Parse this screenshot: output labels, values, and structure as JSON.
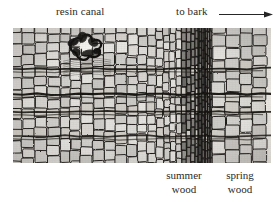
{
  "figure": {
    "type": "light-micrograph",
    "background_color": "#ffffff",
    "image_tone_color": "#e8e6e1",
    "cell_wall_color": "#1c1a18"
  },
  "annotations": {
    "resin_canal": {
      "label": "resin canal",
      "position": "top-left"
    },
    "to_bark": {
      "label": "to bark",
      "position": "top-right",
      "arrow": "arrow-right",
      "arrow_direction": "right"
    },
    "summer_wood": {
      "line1": "summer",
      "line2": "wood",
      "position": "bottom-center-right"
    },
    "spring_wood": {
      "line1": "spring",
      "line2": "wood",
      "position": "bottom-right"
    }
  },
  "regions": {
    "earlywood_left": {
      "name": "spring wood (left, previous ring)",
      "cell_style": "large thin-walled polygonal tracheids"
    },
    "latewood": {
      "name": "summer wood",
      "cell_style": "narrow thick-walled radially-flattened tracheids"
    },
    "earlywood_right": {
      "name": "spring wood",
      "cell_style": "large thin-walled rectangular tracheids"
    }
  },
  "features": {
    "rays": {
      "name": "wood rays",
      "count": 4,
      "orientation": "horizontal"
    },
    "ring_boundary": {
      "name": "annual ring boundary",
      "x_fraction": 0.77
    },
    "resin_duct": {
      "name": "resin canal",
      "x_fraction": 0.28,
      "y_fraction": 0.12
    }
  }
}
